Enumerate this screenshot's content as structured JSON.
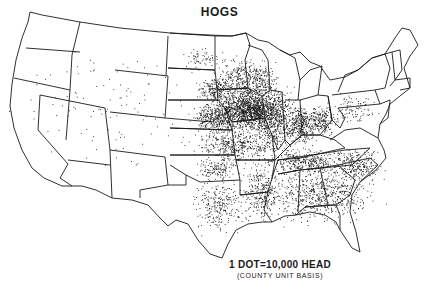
{
  "map": {
    "title": "HOGS",
    "legend": {
      "dot_value": "1 DOT=10,000 HEAD",
      "basis": "(COUNTY UNIT BASIS)"
    },
    "colors": {
      "background": "#ffffff",
      "ink": "#1a1a1a"
    },
    "region": "United States (conterminous)",
    "density_zones": [
      {
        "name": "Iowa core",
        "cx": 252,
        "cy": 110,
        "rx": 28,
        "ry": 16,
        "n": 900
      },
      {
        "name": "Iowa belt",
        "cx": 245,
        "cy": 108,
        "rx": 45,
        "ry": 25,
        "n": 700
      },
      {
        "name": "Illinois",
        "cx": 275,
        "cy": 125,
        "rx": 20,
        "ry": 30,
        "n": 420
      },
      {
        "name": "Indiana",
        "cx": 300,
        "cy": 125,
        "rx": 12,
        "ry": 18,
        "n": 320
      },
      {
        "name": "Ohio",
        "cx": 322,
        "cy": 120,
        "rx": 15,
        "ry": 15,
        "n": 220
      },
      {
        "name": "Minnesota S",
        "cx": 240,
        "cy": 80,
        "rx": 22,
        "ry": 20,
        "n": 300
      },
      {
        "name": "Wisconsin",
        "cx": 262,
        "cy": 80,
        "rx": 14,
        "ry": 18,
        "n": 160
      },
      {
        "name": "Nebraska E",
        "cx": 215,
        "cy": 118,
        "rx": 22,
        "ry": 12,
        "n": 300
      },
      {
        "name": "South Dakota E",
        "cx": 215,
        "cy": 90,
        "rx": 15,
        "ry": 12,
        "n": 170
      },
      {
        "name": "Kansas/Missouri",
        "cx": 235,
        "cy": 145,
        "rx": 38,
        "ry": 16,
        "n": 420
      },
      {
        "name": "Kentucky/Tennessee",
        "cx": 305,
        "cy": 162,
        "rx": 35,
        "ry": 12,
        "n": 380
      },
      {
        "name": "Southeast",
        "cx": 320,
        "cy": 195,
        "rx": 50,
        "ry": 25,
        "n": 620
      },
      {
        "name": "Arkansas/Louisiana",
        "cx": 262,
        "cy": 192,
        "rx": 18,
        "ry": 28,
        "n": 280
      },
      {
        "name": "Oklahoma",
        "cx": 218,
        "cy": 168,
        "rx": 20,
        "ry": 10,
        "n": 140
      },
      {
        "name": "East Texas",
        "cx": 220,
        "cy": 205,
        "rx": 25,
        "ry": 25,
        "n": 260
      },
      {
        "name": "Carolinas/Virginia",
        "cx": 355,
        "cy": 165,
        "rx": 25,
        "ry": 15,
        "n": 260
      },
      {
        "name": "Pennsylvania/NY",
        "cx": 355,
        "cy": 110,
        "rx": 22,
        "ry": 15,
        "n": 90
      },
      {
        "name": "North Dakota",
        "cx": 200,
        "cy": 58,
        "rx": 18,
        "ry": 10,
        "n": 60
      },
      {
        "name": "West sparse",
        "cx": 110,
        "cy": 110,
        "rx": 80,
        "ry": 60,
        "n": 110
      }
    ]
  }
}
